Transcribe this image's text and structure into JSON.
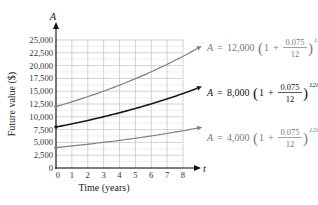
{
  "chart_data": {
    "type": "line",
    "title": "",
    "xlabel": "Time (years)",
    "ylabel": "Future value ($)",
    "x_axis_var": "t",
    "y_axis_var": "A",
    "xlim": [
      0,
      8
    ],
    "ylim": [
      0,
      25000
    ],
    "grid": true,
    "x_ticks": [
      "0",
      "1",
      "2",
      "3",
      "4",
      "5",
      "6",
      "7",
      "8"
    ],
    "y_ticks": [
      "0",
      "2,500",
      "5,000",
      "7,500",
      "10,000",
      "12,500",
      "15,000",
      "17,500",
      "20,000",
      "22,500",
      "25,000"
    ],
    "x": [
      0,
      1,
      2,
      3,
      4,
      5,
      6,
      7,
      8,
      9
    ],
    "series": [
      {
        "name": "A = 12,000(1 + 0.075/12)^{12t}",
        "principal": 12000,
        "color": "#808080",
        "values": [
          12000,
          12931,
          13935,
          15017,
          16183,
          17439,
          18793,
          20252,
          21824,
          23518
        ]
      },
      {
        "name": "A = 8,000(1 + 0.075/12)^{12t}",
        "principal": 8000,
        "color": "#1a1a1a",
        "values": [
          8000,
          8621,
          9290,
          10011,
          10789,
          11626,
          12529,
          13501,
          14549,
          15679
        ]
      },
      {
        "name": "A = 4,000(1 + 0.075/12)^{12t}",
        "principal": 4000,
        "color": "#808080",
        "values": [
          4000,
          4310,
          4645,
          5006,
          5394,
          5813,
          6264,
          6751,
          7275,
          7839
        ]
      }
    ],
    "annotations": [
      {
        "series": 0,
        "lhs": "A",
        "eq": "=",
        "principal": "12,000",
        "one": "1",
        "plus": "+",
        "num": "0.075",
        "den": "12",
        "exp": "12t"
      },
      {
        "series": 1,
        "lhs": "A",
        "eq": "=",
        "principal": "8,000",
        "one": "1",
        "plus": "+",
        "num": "0.075",
        "den": "12",
        "exp": "12t"
      },
      {
        "series": 2,
        "lhs": "A",
        "eq": "=",
        "principal": "4,000",
        "one": "1",
        "plus": "+",
        "num": "0.075",
        "den": "12",
        "exp": "12t"
      }
    ]
  }
}
